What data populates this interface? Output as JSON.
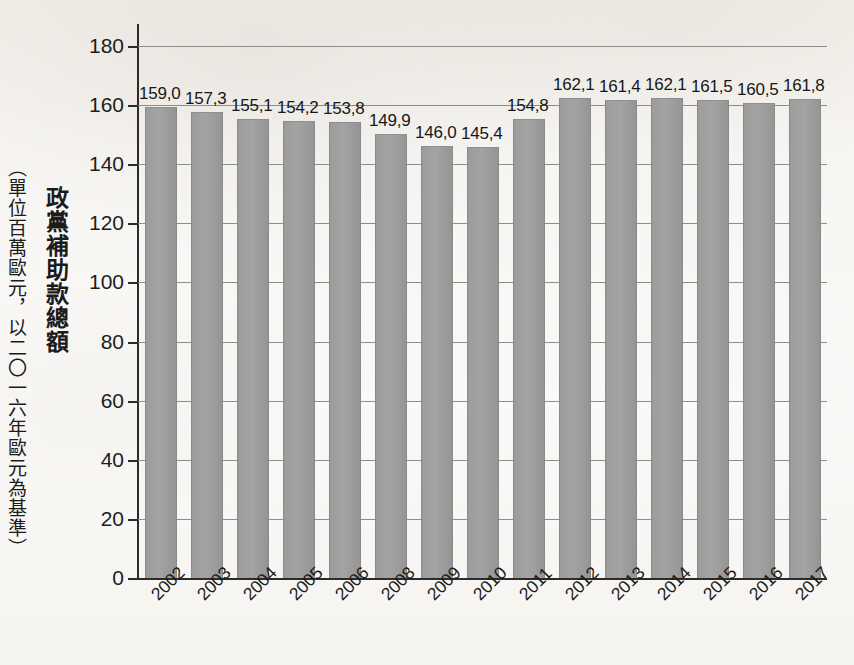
{
  "axis_titles": {
    "primary": "政黨補助款總額",
    "unit": "（單位百萬歐元，以二〇一六年歐元為基準）"
  },
  "chart_data": {
    "type": "bar",
    "title": "政黨補助款總額",
    "xlabel": "",
    "ylabel": "政黨補助款總額（單位百萬歐元，以二〇一六年歐元為基準）",
    "ylim": [
      0,
      180
    ],
    "yticks": [
      0,
      20,
      40,
      60,
      80,
      100,
      120,
      140,
      160,
      180
    ],
    "ytick_labels": [
      "0",
      "20",
      "40",
      "60",
      "80",
      "100",
      "120",
      "140",
      "160",
      "180"
    ],
    "grid": true,
    "legend": null,
    "decimal_separator": ",",
    "bar_color": "#9c9c9c",
    "categories": [
      "2002",
      "2003",
      "2004",
      "2005",
      "2006",
      "2008",
      "2009",
      "2010",
      "2011",
      "2012",
      "2013",
      "2014",
      "2015",
      "2016",
      "2017"
    ],
    "values": [
      159.0,
      157.3,
      155.1,
      154.2,
      153.8,
      149.9,
      146.0,
      145.4,
      154.8,
      162.1,
      161.4,
      162.1,
      161.5,
      160.5,
      161.8
    ],
    "value_labels": [
      "159,0",
      "157,3",
      "155,1",
      "154,2",
      "153,8",
      "149,9",
      "146,0",
      "145,4",
      "154,8",
      "162,1",
      "161,4",
      "162,1",
      "161,5",
      "160,5",
      "161,8"
    ],
    "note": "year 2007 is absent from the category axis"
  }
}
